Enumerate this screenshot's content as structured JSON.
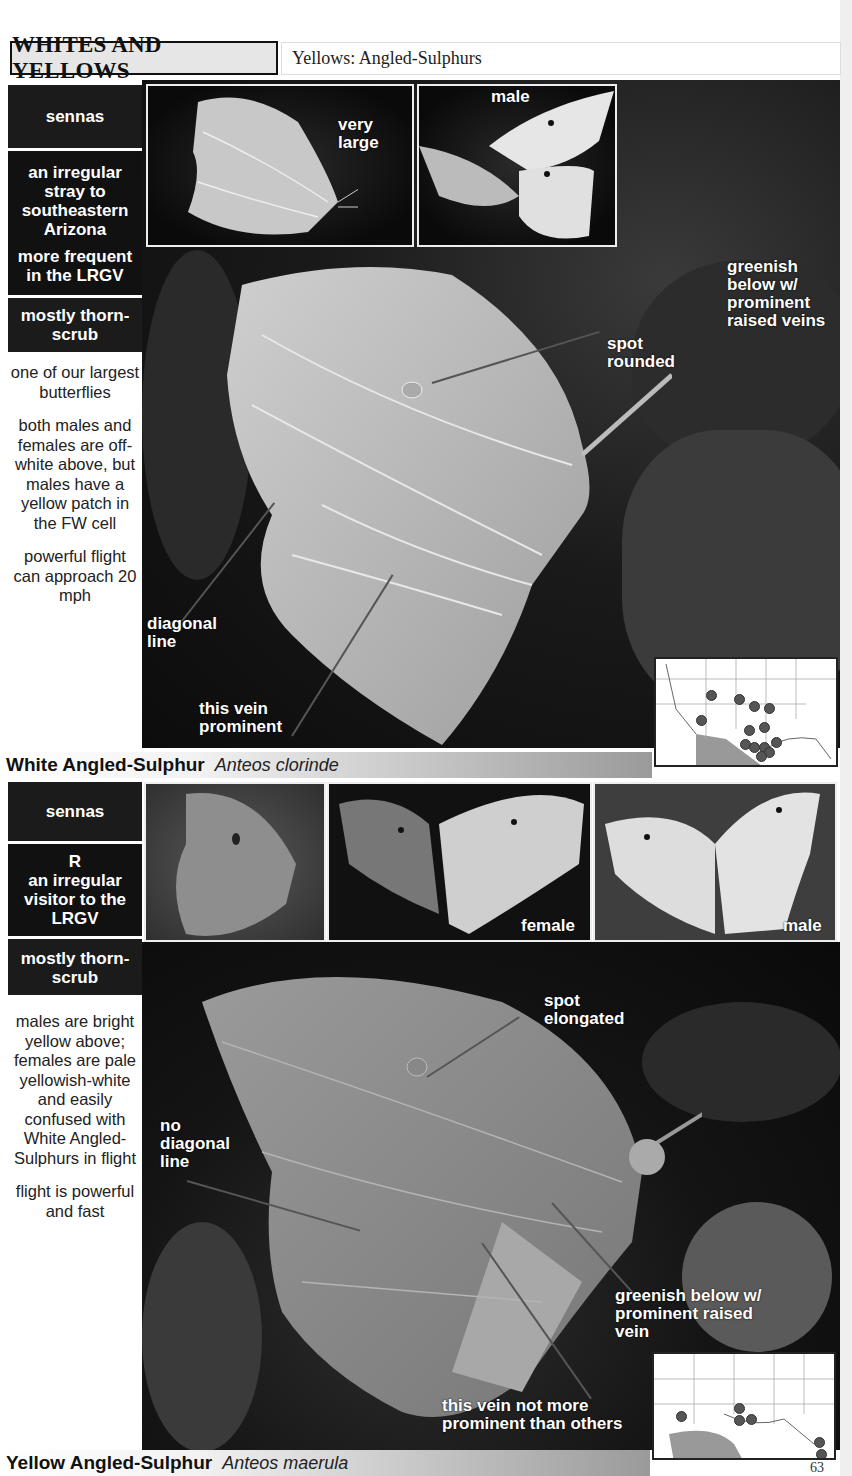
{
  "header": {
    "section_title": "WHITES AND YELLOWS",
    "subsection": "Yellows: Angled-Sulphurs"
  },
  "species": [
    {
      "common_name": "White Angled-Sulphur",
      "scientific_name": "Anteos clorinde",
      "host_plant": "sennas",
      "status_lines": [
        "an irregular stray to southeastern Arizona",
        "more frequent in the LRGV"
      ],
      "habitat": "mostly thorn-scrub",
      "notes": [
        "one of our largest butterflies",
        "both males and females are off-white above, but males have a yellow patch in the FW cell",
        "powerful flight can approach 20 mph"
      ],
      "photo_labels": {
        "thumb1": "very large",
        "thumb2": "male",
        "main_spot": "spot rounded",
        "main_color": "greenish below w/ prominent raised veins",
        "main_diagonal": "diagonal line",
        "main_vein": "this vein prominent"
      },
      "map": {
        "legend": "range map with record dots"
      }
    },
    {
      "common_name": "Yellow Angled-Sulphur",
      "scientific_name": "Anteos maerula",
      "host_plant": "sennas",
      "status_code": "R",
      "status_lines": [
        "an irregular visitor to the LRGV"
      ],
      "habitat": "mostly thorn-scrub",
      "notes": [
        "males are bright yellow above; females are pale yellowish-white and easily confused with White Angled-Sulphurs in flight",
        "flight is powerful and fast"
      ],
      "photo_labels": {
        "thumb2": "female",
        "thumb3": "male",
        "main_spot": "spot elongated",
        "main_diagonal": "no diagonal line",
        "main_color": "greenish below w/ prominent raised vein",
        "main_vein": "this vein not more prominent than others"
      },
      "map": {
        "legend": "range map with record dots"
      }
    }
  ],
  "page_number": "63"
}
